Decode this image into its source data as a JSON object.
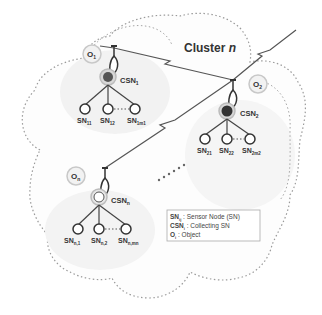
{
  "diagram": {
    "title": "Cluster n",
    "title_main": "Cluster ",
    "title_var": "n",
    "colors": {
      "outline": "#9a9a9a",
      "node_stroke": "#333333",
      "csn_fill_dark": "#4a4a4a",
      "csn_fill_light": "#bdbdbd",
      "link": "#555555",
      "shade": "#f0f0f0"
    },
    "clusters": [
      {
        "object_label": "O1",
        "object_main": "O",
        "object_sub": "1",
        "csn_label": "CSN1",
        "csn_main": "CSN",
        "csn_sub": "1",
        "sensor_nodes": [
          {
            "main": "SN",
            "sub": "11"
          },
          {
            "main": "SN",
            "sub": "12"
          },
          {
            "main": "SN",
            "sub": "1m1"
          }
        ]
      },
      {
        "object_label": "O2",
        "object_main": "O",
        "object_sub": "2",
        "csn_label": "CSN2",
        "csn_main": "CSN",
        "csn_sub": "2",
        "sensor_nodes": [
          {
            "main": "SN",
            "sub": "21"
          },
          {
            "main": "SN",
            "sub": "22"
          },
          {
            "main": "SN",
            "sub": "2m2"
          }
        ]
      },
      {
        "object_label": "On",
        "object_main": "O",
        "object_sub": "n",
        "csn_label": "CSNn",
        "csn_main": "CSN",
        "csn_sub": "n",
        "sensor_nodes": [
          {
            "main": "SN",
            "sub": "n,1"
          },
          {
            "main": "SN",
            "sub": "n,2"
          },
          {
            "main": "SN",
            "sub": "n,mn"
          }
        ]
      }
    ],
    "ellipsis_between_clusters": "......",
    "legend": [
      {
        "symbol_main": "SN",
        "symbol_sub": "ij",
        "separator": " : ",
        "text": "Sensor Node (SN)"
      },
      {
        "symbol_main": "CSN",
        "symbol_sub": "i",
        "separator": " : ",
        "text": "Collecting SN"
      },
      {
        "symbol_main": "O",
        "symbol_sub": "i",
        "separator": " : ",
        "text": "Object"
      }
    ]
  }
}
